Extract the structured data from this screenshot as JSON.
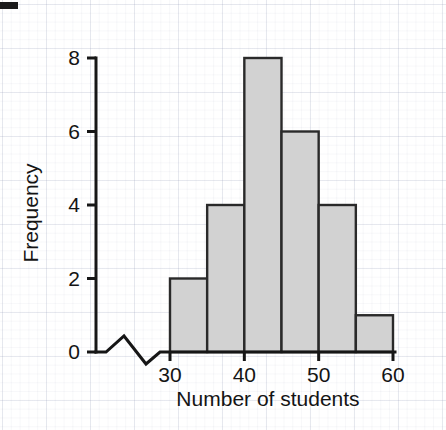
{
  "chart_data": {
    "type": "bar",
    "title": "",
    "subtitle": "",
    "xlabel": "Number of students",
    "ylabel": "Frequency",
    "bin_width": 5,
    "bin_edges": [
      30,
      35,
      40,
      45,
      50,
      55,
      60
    ],
    "categories": [
      "30-35",
      "35-40",
      "40-45",
      "45-50",
      "50-55",
      "55-60"
    ],
    "values": [
      2,
      4,
      8,
      6,
      4,
      1
    ],
    "x_tick_labels": [
      "30",
      "40",
      "50",
      "60"
    ],
    "x_tick_values": [
      30,
      40,
      50,
      60
    ],
    "y_tick_labels": [
      "0",
      "2",
      "4",
      "6",
      "8"
    ],
    "y_tick_values": [
      0,
      2,
      4,
      6,
      8
    ],
    "xlim": [
      30,
      60
    ],
    "ylim": [
      0,
      8
    ],
    "grid": true,
    "legend": "none",
    "axis_break": "x-axis zigzag break between origin and 30",
    "bar_fill_color": "#d2d2d2",
    "bar_edge_color": "#2a2a2a",
    "axis_color": "#161616",
    "background_color": "#ffffff",
    "grid_color": "#96a0b9"
  },
  "figure": {
    "y_axis_title": "Frequency",
    "x_axis_title": "Number of students"
  }
}
